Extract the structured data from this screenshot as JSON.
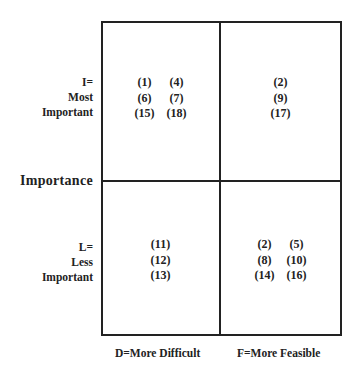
{
  "diagram": {
    "type": "2x2 matrix",
    "y_axis_title": "Importance",
    "y_labels": {
      "top": [
        "I=",
        "Most",
        "Important"
      ],
      "bottom": [
        "L=",
        "Less",
        "Important"
      ]
    },
    "x_labels": {
      "left": "D=More Difficult",
      "right": "F=More Feasible"
    },
    "quadrants": {
      "most_important_more_difficult": [
        [
          "(1)",
          "(4)"
        ],
        [
          "(6)",
          "(7)"
        ],
        [
          "(15)",
          "(18)"
        ]
      ],
      "most_important_more_feasible": [
        [
          "(2)"
        ],
        [
          "(9)"
        ],
        [
          "(17)"
        ]
      ],
      "less_important_more_difficult": [
        [
          "(11)"
        ],
        [
          "(12)"
        ],
        [
          "(13)"
        ]
      ],
      "less_important_more_feasible": [
        [
          "(2)",
          "(5)"
        ],
        [
          "(8)",
          "(10)"
        ],
        [
          "(14)",
          "(16)"
        ]
      ]
    },
    "line_color": "#222222"
  }
}
